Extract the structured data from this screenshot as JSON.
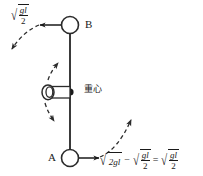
{
  "figure": {
    "background_color": "#ffffff",
    "ink_color": "#1a1a1a",
    "points": {
      "b": {
        "label": "B"
      },
      "a": {
        "label": "A"
      }
    },
    "center_of_gravity": {
      "label": "重心"
    },
    "velocity_b": {
      "radical_numerator": "gl",
      "radical_denominator": "2"
    },
    "equation_a": {
      "term1_radicand": "2gl",
      "operator_minus": "−",
      "term2_numerator": "gl",
      "term2_denominator": "2",
      "operator_equals": "=",
      "term3_numerator": "gl",
      "term3_denominator": "2"
    }
  }
}
